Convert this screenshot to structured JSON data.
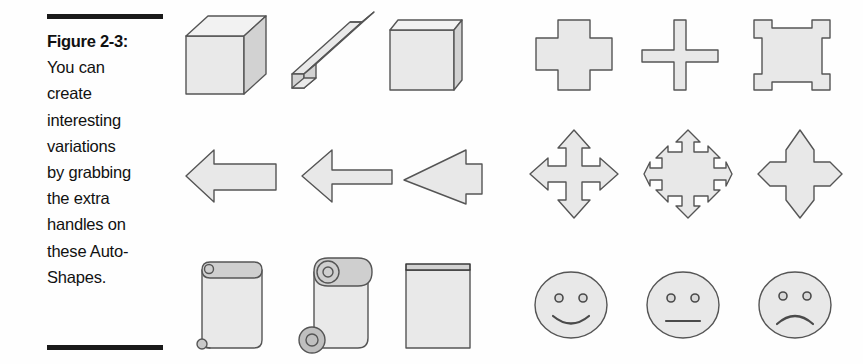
{
  "figure": {
    "label": "Figure 2-3:",
    "caption_lines": [
      "You can",
      "create",
      "interesting",
      "variations",
      "by grabbing",
      "the extra",
      "handles on",
      "these Auto-",
      "Shapes."
    ],
    "caption_full": "Figure 2-3: You can create interesting variations by grabbing the extra handles on these AutoShapes.",
    "rule_color": "#1a1a1a",
    "text_color": "#111111"
  },
  "palette": {
    "shape_fill": "#e9e9e9",
    "shape_fill_top": "#f2f2f2",
    "shape_fill_side": "#d2d2d2",
    "shape_outline": "#555555",
    "feature_stroke": "#4a4a4a",
    "page_background": "#fefefe"
  },
  "shapes": {
    "rows": [
      {
        "row": 1,
        "left_group": [
          {
            "name": "cube",
            "label": "Cube"
          },
          {
            "name": "bevel-bar",
            "label": "Cube stretched thin (bar)"
          },
          {
            "name": "flat-cube",
            "label": "Cube flattened (slab)"
          }
        ],
        "right_group": [
          {
            "name": "cross-thick",
            "label": "Cross (thick arms)"
          },
          {
            "name": "cross-thin",
            "label": "Cross (thin arms)"
          },
          {
            "name": "cross-inverted",
            "label": "Cross (notched square)"
          }
        ]
      },
      {
        "row": 2,
        "left_group": [
          {
            "name": "left-arrow-wide",
            "label": "Left arrow (wide body)"
          },
          {
            "name": "left-arrow-thin",
            "label": "Left arrow (thin body)"
          },
          {
            "name": "left-arrow-sharp",
            "label": "Left arrow (long head)"
          }
        ],
        "right_group": [
          {
            "name": "four-way-arrow",
            "label": "4-way arrow"
          },
          {
            "name": "four-way-arrow-stubby",
            "label": "4-way arrow (stubby points)"
          },
          {
            "name": "four-way-arrow-pointed",
            "label": "4-way arrow (pointed cross)"
          }
        ]
      },
      {
        "row": 3,
        "left_group": [
          {
            "name": "scroll-vertical-small-curl",
            "label": "Vertical scroll (small curl)"
          },
          {
            "name": "scroll-vertical-large-curl",
            "label": "Vertical scroll (large curl)"
          },
          {
            "name": "scroll-vertical-flat",
            "label": "Vertical scroll (flat)"
          }
        ],
        "right_group": [
          {
            "name": "smiley-face-happy",
            "label": "Smiley face (smile)"
          },
          {
            "name": "smiley-face-neutral",
            "label": "Smiley face (neutral)"
          },
          {
            "name": "smiley-face-sad",
            "label": "Smiley face (frown)"
          }
        ]
      }
    ]
  }
}
